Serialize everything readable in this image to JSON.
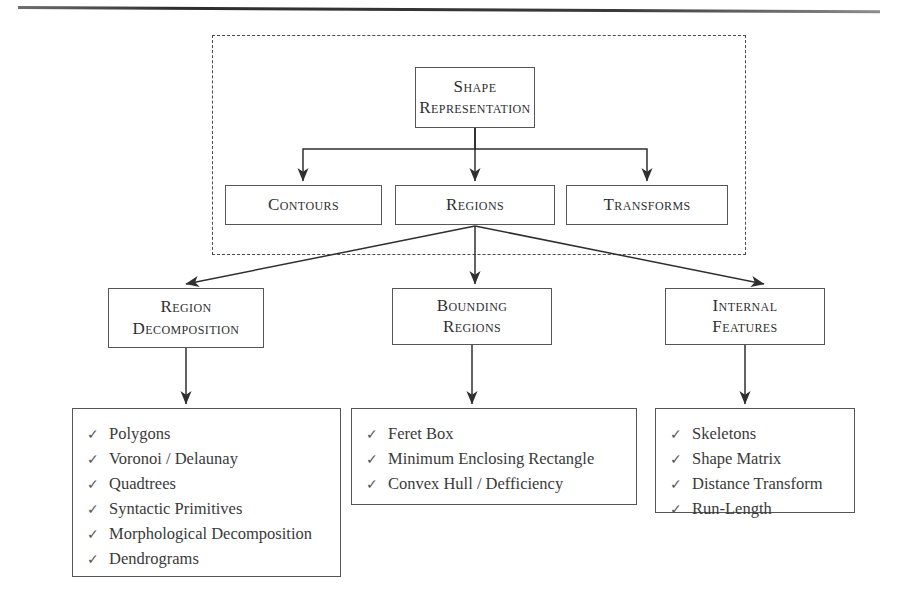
{
  "diagram": {
    "title_node": {
      "lines": [
        "Shape",
        "Representation"
      ]
    },
    "level2": [
      {
        "lines": [
          "Contours"
        ]
      },
      {
        "lines": [
          "Regions"
        ]
      },
      {
        "lines": [
          "Transforms"
        ]
      }
    ],
    "level3": [
      {
        "lines": [
          "Region",
          "Decomposition"
        ]
      },
      {
        "lines": [
          "Bounding",
          "Regions"
        ]
      },
      {
        "lines": [
          "Internal",
          "Features"
        ]
      }
    ],
    "bullet_glyph": "✓",
    "lists": [
      {
        "items": [
          "Polygons",
          "Voronoi / Delaunay",
          "Quadtrees",
          "Syntactic Primitives",
          "Morphological Decomposition",
          "Dendrograms"
        ]
      },
      {
        "items": [
          "Feret Box",
          "Minimum Enclosing Rectangle",
          "Convex Hull / Defficiency"
        ]
      },
      {
        "items": [
          "Skeletons",
          "Shape Matrix",
          "Distance Transform",
          "Run-Length"
        ]
      }
    ],
    "colors": {
      "ink": "#3a3a3a",
      "box_border": "#565656",
      "dashed_border": "#4a4a4a",
      "background": "#ffffff"
    }
  }
}
